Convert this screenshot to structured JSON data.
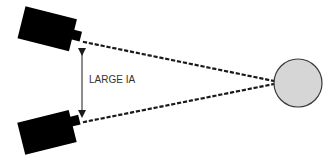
{
  "diagram": {
    "label": "LARGE IA",
    "colors": {
      "camera": "#000000",
      "sightline": "#1a1a1a",
      "arrow": "#1a1a1a",
      "target_fill": "#d6d6d6",
      "target_stroke": "#3a3a3a",
      "background": "#ffffff"
    },
    "elements": {
      "camera_top": "camera-icon",
      "camera_bottom": "camera-icon",
      "target": "sphere",
      "dimension": "double-arrow"
    }
  }
}
